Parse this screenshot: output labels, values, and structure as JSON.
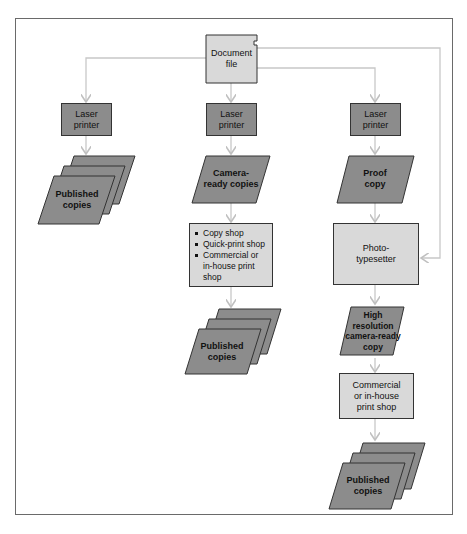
{
  "diagram": {
    "source": {
      "label_line1": "Document",
      "label_line2": "file"
    },
    "columns": [
      {
        "printer": {
          "line1": "Laser",
          "line2": "printer"
        },
        "output": {
          "line1": "Published",
          "line2": "copies"
        }
      },
      {
        "printer": {
          "line1": "Laser",
          "line2": "printer"
        },
        "intermediate": {
          "line1": "Camera-",
          "line2": "ready copies"
        },
        "shops": [
          "Copy shop",
          "Quick-print shop",
          "Commercial or in-house print shop"
        ],
        "output": {
          "line1": "Published",
          "line2": "copies"
        }
      },
      {
        "printer": {
          "line1": "Laser",
          "line2": "printer"
        },
        "proof": {
          "line1": "Proof",
          "line2": "copy"
        },
        "typesetter": {
          "line1": "Photo-",
          "line2": "typesetter"
        },
        "hires": {
          "line1": "High",
          "line2": "resolution",
          "line3": "camera-ready",
          "line4": "copy"
        },
        "shop": {
          "line1": "Commercial",
          "line2": "or in-house",
          "line3": "print shop"
        },
        "output": {
          "line1": "Published",
          "line2": "copies"
        }
      }
    ],
    "colors": {
      "light_fill": "#d9d9d9",
      "dark_fill": "#8c8c8c",
      "line": "#c8c8c8",
      "frame": "#6a6a6a"
    }
  }
}
